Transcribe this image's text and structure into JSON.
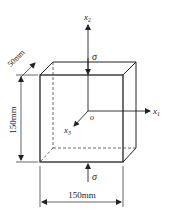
{
  "diagram": {
    "type": "cube-stress-element",
    "colors": {
      "line": "#222222",
      "background": "#ffffff"
    },
    "axes": {
      "x1": {
        "label_main": "x",
        "label_sub": "1"
      },
      "x2": {
        "label_main": "x",
        "label_sub": "2"
      },
      "x3": {
        "label_main": "x",
        "label_sub": "3"
      },
      "origin": "o"
    },
    "stress": {
      "top": "σ",
      "bottom": "σ"
    },
    "dimensions": {
      "depth": "50mm",
      "height": "150mm",
      "width": "150mm"
    }
  }
}
